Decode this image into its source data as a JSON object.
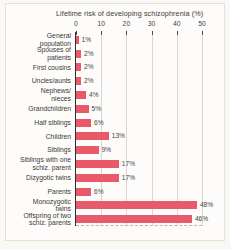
{
  "chart_data": {
    "type": "bar",
    "orientation": "horizontal",
    "title": "Lifetime risk of  developing schizophrenia (%)",
    "xlabel": "",
    "ylabel": "",
    "xlim": [
      0,
      50
    ],
    "xticks": [
      0,
      10,
      20,
      30,
      40,
      50
    ],
    "xtick_labels": [
      "0",
      "10",
      "20",
      "30",
      "40",
      "50"
    ],
    "grid": true,
    "legend": "none",
    "bar_color": "#e8596a",
    "categories": [
      "General\npopulation",
      "Spouses of\npatients",
      "First cousins",
      "Uncles/aunts",
      "Nephews/\nnieces",
      "Grandchildren",
      "Half siblings",
      "Children",
      "Siblings",
      "Siblings with one\nschiz. parent",
      "Dizygotic twins",
      "Parents",
      "Monozygotic\ntwins",
      "Offspring of two\nschiz. parents"
    ],
    "values": [
      1,
      2,
      2,
      2,
      4,
      5,
      6,
      13,
      9,
      17,
      17,
      6,
      48,
      46
    ],
    "value_labels": [
      "1%",
      "2%",
      "2%",
      "2%",
      "4%",
      "5%",
      "6%",
      "13%",
      "9%",
      "17%",
      "17%",
      "6%",
      "48%",
      "46%"
    ]
  }
}
